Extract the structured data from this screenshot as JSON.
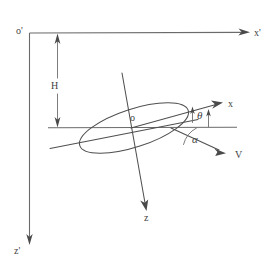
{
  "figure": {
    "background_color": "#ffffff",
    "line_color": "#5a5a5a",
    "width": 275,
    "height": 271
  },
  "labels": {
    "origin_ground": "o'",
    "axis_x_ground": "x'",
    "axis_z_ground": "z'",
    "altitude": "H",
    "origin_body": "o",
    "axis_x_body": "x",
    "axis_z_body": "z",
    "velocity": "V",
    "angle_theta": "θ",
    "angle_alpha": "α"
  },
  "elements": [
    {
      "name": "ground-vertical-axis",
      "kind": "axis",
      "label": "z'"
    },
    {
      "name": "ground-horizontal-axis",
      "kind": "axis",
      "label": "x'"
    },
    {
      "name": "altitude-dimension",
      "kind": "dimension",
      "label": "H"
    },
    {
      "name": "horizontal-reference-line",
      "kind": "reference-line",
      "label": ""
    },
    {
      "name": "body-ellipse",
      "kind": "body-outline",
      "label": ""
    },
    {
      "name": "body-x-axis",
      "kind": "axis",
      "label": "x"
    },
    {
      "name": "body-z-axis",
      "kind": "axis",
      "label": "z"
    },
    {
      "name": "velocity-vector",
      "kind": "vector",
      "label": "V"
    },
    {
      "name": "theta-angle-arc",
      "kind": "angle",
      "label": "θ"
    },
    {
      "name": "alpha-angle-arc",
      "kind": "angle",
      "label": "α"
    }
  ]
}
